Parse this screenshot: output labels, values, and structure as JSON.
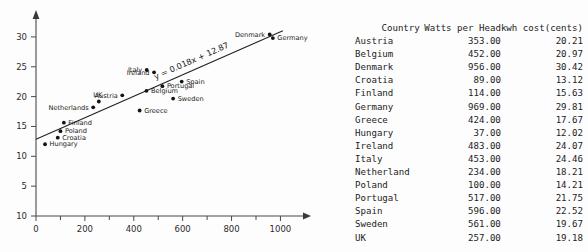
{
  "chart_data": {
    "type": "scatter",
    "title": "",
    "xlabel": "",
    "ylabel": "",
    "xlim": [
      0,
      1080
    ],
    "ylim": [
      0,
      32.5
    ],
    "grid": false,
    "legend": null,
    "x_ticks": [
      0,
      200,
      400,
      600,
      800,
      1000
    ],
    "x_tick_labels": [
      "0",
      "200",
      "400",
      "600",
      "800",
      "1000"
    ],
    "x_minor_ticks": [
      100,
      300,
      500,
      700,
      900
    ],
    "y_ticks": [
      0,
      5,
      10,
      15,
      20,
      25,
      30
    ],
    "y_tick_labels": [
      "10",
      "5",
      "10",
      "15",
      "20",
      "25",
      "30"
    ],
    "points": [
      {
        "label": "Austria",
        "x": 353,
        "y": 20.21,
        "label_pos": "left"
      },
      {
        "label": "Belgium",
        "x": 452,
        "y": 20.97,
        "label_pos": "right"
      },
      {
        "label": "Denmark",
        "x": 956,
        "y": 30.42,
        "label_pos": "left"
      },
      {
        "label": "Croatia",
        "x": 89,
        "y": 13.12,
        "label_pos": "right"
      },
      {
        "label": "Finland",
        "x": 114,
        "y": 15.63,
        "label_pos": "right"
      },
      {
        "label": "Germany",
        "x": 969,
        "y": 29.81,
        "label_pos": "right"
      },
      {
        "label": "Greece",
        "x": 424,
        "y": 17.67,
        "label_pos": "right"
      },
      {
        "label": "Hungary",
        "x": 37,
        "y": 12.02,
        "label_pos": "right"
      },
      {
        "label": "Ireland",
        "x": 483,
        "y": 24.07,
        "label_pos": "left"
      },
      {
        "label": "Italy",
        "x": 453,
        "y": 24.46,
        "label_pos": "left"
      },
      {
        "label": "Netherlands",
        "x": 234,
        "y": 18.21,
        "label_pos": "left"
      },
      {
        "label": "Poland",
        "x": 100,
        "y": 14.21,
        "label_pos": "right"
      },
      {
        "label": "Portugal",
        "x": 517,
        "y": 21.75,
        "label_pos": "right"
      },
      {
        "label": "Spain",
        "x": 596,
        "y": 22.52,
        "label_pos": "right"
      },
      {
        "label": "Sweden",
        "x": 561,
        "y": 19.67,
        "label_pos": "right"
      },
      {
        "label": "UK",
        "x": 257,
        "y": 19.18,
        "label_pos": "above"
      }
    ],
    "trendline": {
      "slope": 0.018,
      "intercept": 12.87,
      "annotation": "y = 0.018x + 12.87",
      "x_start": 0,
      "x_end": 1010
    }
  },
  "table": {
    "headers": [
      "Country",
      "Watts per Head",
      "kwh cost(cents)"
    ],
    "rows": [
      [
        "Austria",
        "353.00",
        "20.21"
      ],
      [
        "Belgium",
        "452.00",
        "20.97"
      ],
      [
        "Denmark",
        "956.00",
        "30.42"
      ],
      [
        "Croatia",
        "89.00",
        "13.12"
      ],
      [
        "Finland",
        "114.00",
        "15.63"
      ],
      [
        "Germany",
        "969.00",
        "29.81"
      ],
      [
        "Greece",
        "424.00",
        "17.67"
      ],
      [
        "Hungary",
        "37.00",
        "12.02"
      ],
      [
        "Ireland",
        "483.00",
        "24.07"
      ],
      [
        "Italy",
        "453.00",
        "24.46"
      ],
      [
        "Netherland",
        "234.00",
        "18.21"
      ],
      [
        "Poland",
        "100.00",
        "14.21"
      ],
      [
        "Portugal",
        "517.00",
        "21.75"
      ],
      [
        "Spain",
        "596.00",
        "22.52"
      ],
      [
        "Sweden",
        "561.00",
        "19.67"
      ],
      [
        "UK",
        "257.00",
        "19.18"
      ]
    ],
    "equation": "y = 0.018*x + 12.870"
  },
  "colors": {
    "axis": "#4a4a4a",
    "point": "#141414",
    "trend": "#1f1f1f",
    "text": "#1c1c1c",
    "background": "#fdfdfd"
  }
}
